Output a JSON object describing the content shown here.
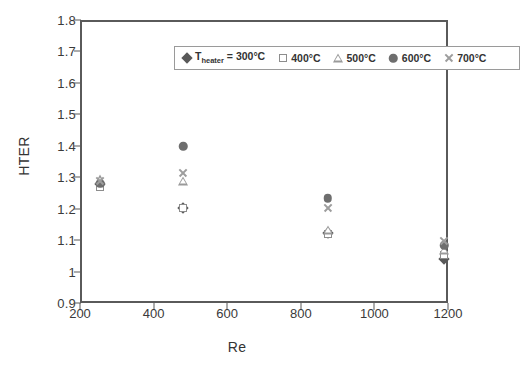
{
  "chart_data": {
    "type": "scatter",
    "title": "",
    "xlabel": "Re",
    "ylabel": "HTER",
    "xlim": [
      200,
      1200
    ],
    "ylim": [
      0.9,
      1.8
    ],
    "xticks": [
      "200",
      "400",
      "600",
      "800",
      "1000",
      "1200"
    ],
    "xtick_values": [
      200,
      400,
      600,
      800,
      1000,
      1200
    ],
    "yticks": [
      "0.9",
      "1",
      "1.1",
      "1.2",
      "1.3",
      "1.4",
      "1.5",
      "1.6",
      "1.7",
      "1.8"
    ],
    "ytick_values": [
      0.9,
      1.0,
      1.1,
      1.2,
      1.3,
      1.4,
      1.5,
      1.6,
      1.7,
      1.8
    ],
    "grid": false,
    "legend_position": "top-inside",
    "legend_prefix": "T",
    "legend_prefix_sub": "heater",
    "legend_prefix_eq": " = ",
    "series": [
      {
        "name": "300°C",
        "label": "300°C",
        "marker": "diamond",
        "color": "#595959",
        "x": [
          250,
          475,
          868,
          1185
        ],
        "y": [
          1.285,
          1.21,
          1.13,
          1.045
        ]
      },
      {
        "name": "400°C",
        "label": "400°C",
        "marker": "square",
        "color": "#8d8d8d",
        "x": [
          250,
          475,
          868,
          1185
        ],
        "y": [
          1.275,
          1.207,
          1.125,
          1.06
        ]
      },
      {
        "name": "500°C",
        "label": "500°C",
        "marker": "triangle",
        "color": "#9a9a9a",
        "x": [
          250,
          475,
          868,
          1185
        ],
        "y": [
          1.3,
          1.295,
          1.14,
          1.075
        ]
      },
      {
        "name": "600°C",
        "label": "600°C",
        "marker": "circle",
        "color": "#6e6e6e",
        "x": [
          250,
          475,
          868,
          1185
        ],
        "y": [
          1.285,
          1.405,
          1.24,
          1.09
        ]
      },
      {
        "name": "700°C",
        "label": "700°C",
        "marker": "cross",
        "color": "#9d9d9d",
        "x": [
          250,
          475,
          868,
          1185
        ],
        "y": [
          1.295,
          1.32,
          1.21,
          1.105
        ]
      }
    ]
  },
  "axes": {
    "x_title": "Re",
    "y_title": "HTER"
  }
}
